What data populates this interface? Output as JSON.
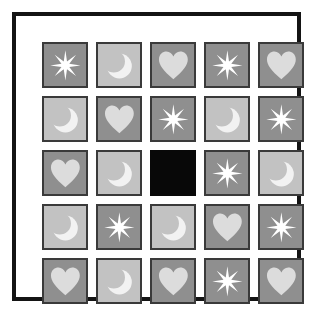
{
  "puzzle": {
    "title": "Matrix Reasoning Puzzle",
    "rows": 5,
    "columns": 5,
    "colors": {
      "page_background": "#ffffff",
      "frame": "#141414",
      "cell_border": "#3a3a3a",
      "background_dark": "#8f8f8f",
      "background_light": "#c2c2c2",
      "blank_cell": "#080808",
      "symbol_white": "#ffffff",
      "symbol_light": "#dcdcdc",
      "symbol_moon": "#f2f2f2"
    },
    "symbol_names": {
      "star": "eight-point-star-icon",
      "moon": "crescent-moon-icon",
      "heart": "heart-icon",
      "blank": "blank-missing-cell"
    },
    "cells": [
      [
        {
          "symbol": "star",
          "background": "dark",
          "symbol_color": "#ffffff"
        },
        {
          "symbol": "moon",
          "background": "light",
          "symbol_color": "#f2f2f2"
        },
        {
          "symbol": "heart",
          "background": "dark",
          "symbol_color": "#dcdcdc"
        },
        {
          "symbol": "star",
          "background": "dark",
          "symbol_color": "#ffffff"
        },
        {
          "symbol": "heart",
          "background": "dark",
          "symbol_color": "#dcdcdc"
        }
      ],
      [
        {
          "symbol": "moon",
          "background": "light",
          "symbol_color": "#f2f2f2"
        },
        {
          "symbol": "heart",
          "background": "dark",
          "symbol_color": "#dcdcdc"
        },
        {
          "symbol": "star",
          "background": "dark",
          "symbol_color": "#ffffff"
        },
        {
          "symbol": "moon",
          "background": "light",
          "symbol_color": "#f2f2f2"
        },
        {
          "symbol": "star",
          "background": "dark",
          "symbol_color": "#ffffff"
        }
      ],
      [
        {
          "symbol": "heart",
          "background": "dark",
          "symbol_color": "#dcdcdc"
        },
        {
          "symbol": "moon",
          "background": "light",
          "symbol_color": "#f2f2f2"
        },
        {
          "symbol": "blank",
          "background": "blank",
          "symbol_color": "#080808"
        },
        {
          "symbol": "star",
          "background": "dark",
          "symbol_color": "#ffffff"
        },
        {
          "symbol": "moon",
          "background": "light",
          "symbol_color": "#f2f2f2"
        }
      ],
      [
        {
          "symbol": "moon",
          "background": "light",
          "symbol_color": "#f2f2f2"
        },
        {
          "symbol": "star",
          "background": "dark",
          "symbol_color": "#ffffff"
        },
        {
          "symbol": "moon",
          "background": "light",
          "symbol_color": "#f2f2f2"
        },
        {
          "symbol": "heart",
          "background": "dark",
          "symbol_color": "#dcdcdc"
        },
        {
          "symbol": "star",
          "background": "dark",
          "symbol_color": "#ffffff"
        }
      ],
      [
        {
          "symbol": "heart",
          "background": "dark",
          "symbol_color": "#dcdcdc"
        },
        {
          "symbol": "moon",
          "background": "light",
          "symbol_color": "#f2f2f2"
        },
        {
          "symbol": "heart",
          "background": "dark",
          "symbol_color": "#dcdcdc"
        },
        {
          "symbol": "star",
          "background": "dark",
          "symbol_color": "#ffffff"
        },
        {
          "symbol": "heart",
          "background": "dark",
          "symbol_color": "#dcdcdc"
        }
      ]
    ]
  }
}
